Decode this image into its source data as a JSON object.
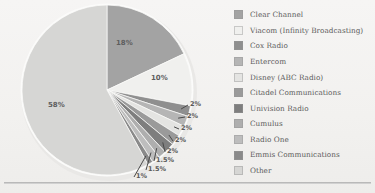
{
  "chart_data": {
    "type": "pie",
    "title": "",
    "xlabel": "",
    "ylabel": "",
    "legend_position": "right",
    "grid": false,
    "start_angle_oclock": 12,
    "direction": "clockwise",
    "categories": [
      "Clear Channel",
      "Viacom (Infinity Broadcasting)",
      "Cox Radio",
      "Entercom",
      "Disney (ABC Radio)",
      "Citadel Communications",
      "Univision Radio",
      "Cumulus",
      "Radio One",
      "Emmis Communications",
      "Other"
    ],
    "values": [
      18,
      10,
      2,
      2,
      2,
      2,
      2,
      1.5,
      1.5,
      1,
      58
    ],
    "value_labels": [
      "18%",
      "10%",
      "2%",
      "2%",
      "2%",
      "2%",
      "2%",
      "1.5%",
      "1.5%",
      "1%",
      "58%"
    ],
    "colors": [
      "#a3a3a3",
      "#f0f0ee",
      "#8f8f8f",
      "#b5b5b5",
      "#e4e4e2",
      "#9a9a9a",
      "#7e7e7e",
      "#aeaeae",
      "#bdbdbd",
      "#8a8a8a",
      "#d6d6d4"
    ],
    "inner_labels": [
      {
        "text": "18%",
        "x": 116,
        "y": 39
      },
      {
        "text": "10%",
        "x": 151,
        "y": 74
      },
      {
        "text": "58%",
        "x": 48,
        "y": 101
      }
    ],
    "callouts": [
      {
        "text": "2%",
        "x": 190,
        "y": 100
      },
      {
        "text": "2%",
        "x": 187,
        "y": 112
      },
      {
        "text": "2%",
        "x": 181,
        "y": 124
      },
      {
        "text": "2%",
        "x": 175,
        "y": 136
      },
      {
        "text": "2%",
        "x": 167,
        "y": 147
      },
      {
        "text": "1.5%",
        "x": 156,
        "y": 156
      },
      {
        "text": "1.5%",
        "x": 148,
        "y": 165
      },
      {
        "text": "1%",
        "x": 136,
        "y": 172
      }
    ]
  },
  "legend": {
    "items": [
      {
        "label": "Clear Channel",
        "color": "#a3a3a3"
      },
      {
        "label": "Viacom (Infinity Broadcasting)",
        "color": "#f0f0ee"
      },
      {
        "label": "Cox Radio",
        "color": "#8f8f8f"
      },
      {
        "label": "Entercom",
        "color": "#b5b5b5"
      },
      {
        "label": "Disney (ABC Radio)",
        "color": "#e4e4e2"
      },
      {
        "label": "Citadel Communications",
        "color": "#9a9a9a"
      },
      {
        "label": "Univision Radio",
        "color": "#7e7e7e"
      },
      {
        "label": "Cumulus",
        "color": "#aeaeae"
      },
      {
        "label": "Radio One",
        "color": "#bdbdbd"
      },
      {
        "label": "Emmis Communications",
        "color": "#8a8a8a"
      },
      {
        "label": "Other",
        "color": "#d6d6d4"
      }
    ]
  }
}
